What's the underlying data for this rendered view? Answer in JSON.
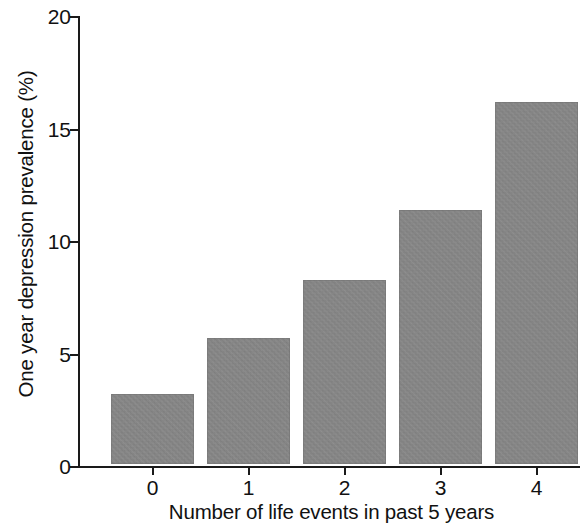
{
  "chart_data": {
    "type": "bar",
    "title": "",
    "xlabel": "Number of life events in past 5 years",
    "ylabel": "One year depression prevalence (%)",
    "categories": [
      "0",
      "1",
      "2",
      "3",
      "4"
    ],
    "values": [
      3.1,
      5.6,
      8.2,
      11.3,
      16.1
    ],
    "ylim": [
      0,
      20
    ],
    "yticks": [
      0,
      5,
      10,
      15,
      20
    ],
    "ytick_labels": [
      "0",
      "5",
      "10",
      "15",
      "20"
    ],
    "xtick_labels": [
      "0",
      "1",
      "2",
      "3",
      "4"
    ],
    "grid": false,
    "legend": null,
    "bar_color": "#8a8a8a",
    "axis_color": "#1a1a1a",
    "background_color": "#ffffff"
  },
  "axes": {
    "y_title": "One year depression prevalence (%)",
    "x_title": "Number of life events in past 5 years"
  },
  "ticks": {
    "y": [
      {
        "label": "20",
        "value": 20
      },
      {
        "label": "15",
        "value": 15
      },
      {
        "label": "10",
        "value": 10
      },
      {
        "label": "5",
        "value": 5
      },
      {
        "label": "0",
        "value": 0
      }
    ],
    "x": [
      {
        "label": "0"
      },
      {
        "label": "1"
      },
      {
        "label": "2"
      },
      {
        "label": "3"
      },
      {
        "label": "4"
      }
    ]
  }
}
